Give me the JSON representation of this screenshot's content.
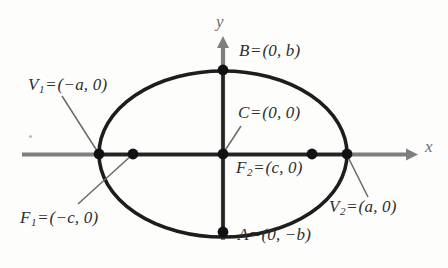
{
  "figure": {
    "kind": "ellipse-diagram",
    "background_color": "#fdfdfc",
    "curve_color": "#1d1d1d",
    "axis_color": "#7a7a7a",
    "text_color": "#2e2e2e",
    "leader_color": "#6a6a6a"
  },
  "axes": {
    "x_label": "x",
    "y_label": "y",
    "origin": {
      "x": 223,
      "y": 154
    },
    "x_axis": {
      "from_x": 22,
      "to_x": 412,
      "arrow": "right"
    },
    "y_axis": {
      "from_y": 238,
      "to_y": 38,
      "arrow": "up"
    }
  },
  "ellipse": {
    "center_x": 223,
    "center_y": 154,
    "semi_major_a": 124,
    "semi_minor_b": 83
  },
  "points": [
    {
      "id": "V1",
      "label": "V",
      "subscript": "1",
      "equals": "=",
      "coords": "(−a, 0)",
      "full_text": "V₁ = (−a, 0)",
      "role": "left-vertex",
      "px": 99,
      "py": 154
    },
    {
      "id": "F1",
      "label": "F",
      "subscript": "1",
      "equals": "=",
      "coords": "(−c, 0)",
      "full_text": "F₁ = (−c, 0)",
      "role": "left-focus",
      "px": 133,
      "py": 154
    },
    {
      "id": "C",
      "label": "C",
      "subscript": "",
      "equals": "=",
      "coords": "(0, 0)",
      "full_text": "C = (0, 0)",
      "role": "center",
      "px": 223,
      "py": 154
    },
    {
      "id": "F2",
      "label": "F",
      "subscript": "2",
      "equals": "=",
      "coords": "(c, 0)",
      "full_text": "F₂ = (c, 0)",
      "role": "right-focus",
      "px": 312,
      "py": 154
    },
    {
      "id": "V2",
      "label": "V",
      "subscript": "2",
      "equals": "=",
      "coords": "(a, 0)",
      "full_text": "V₂ = (a, 0)",
      "role": "right-vertex",
      "px": 347,
      "py": 154
    },
    {
      "id": "B",
      "label": "B",
      "subscript": "",
      "equals": "=",
      "coords": "(0, b)",
      "full_text": "B = (0, b)",
      "role": "top-co-vertex",
      "px": 223,
      "py": 70
    },
    {
      "id": "A",
      "label": "A",
      "subscript": "",
      "equals": "=",
      "coords": "(0, −b)",
      "full_text": "A = (0, −b)",
      "role": "bottom-co-vertex",
      "px": 223,
      "py": 232
    }
  ],
  "leader_lines": [
    {
      "name": "v1-leader",
      "x1": 62,
      "y1": 96,
      "x2": 99,
      "y2": 154
    },
    {
      "name": "f1-leader",
      "x1": 78,
      "y1": 204,
      "x2": 133,
      "y2": 154
    },
    {
      "name": "c-leader",
      "x1": 241,
      "y1": 126,
      "x2": 224,
      "y2": 152
    },
    {
      "name": "v2-leader",
      "x1": 347,
      "y1": 155,
      "x2": 368,
      "y2": 197
    }
  ]
}
